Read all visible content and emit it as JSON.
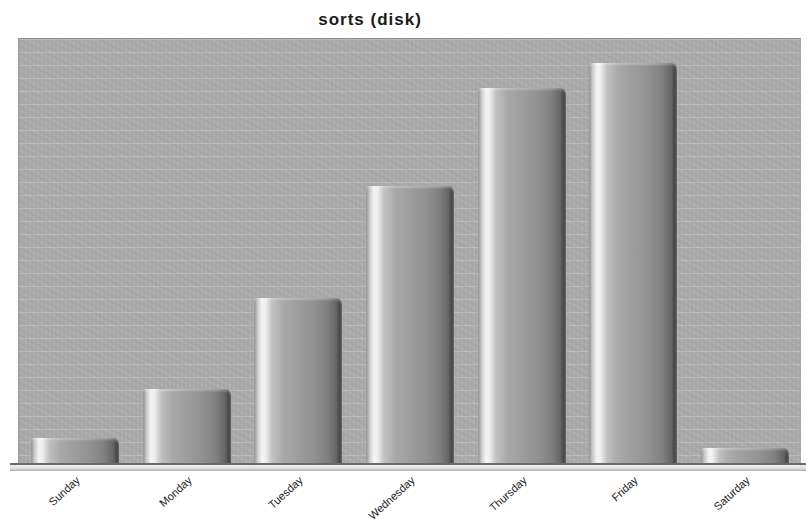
{
  "chart_data": {
    "type": "bar",
    "title": "sorts (disk)",
    "categories": [
      "Sunday",
      "Monday",
      "Tuesday",
      "Wednesday",
      "Thursday",
      "Friday",
      "Saturday"
    ],
    "values_relative_pct": [
      6.3,
      17.8,
      39.2,
      65.5,
      88.5,
      94.4,
      4.0
    ],
    "xlabel": "",
    "ylabel": "",
    "y_axis_tick_labels": [],
    "axis_ranges": {
      "y_pct": [
        0,
        100
      ]
    },
    "legend": "none",
    "grid": "faint horizontal light stripes on gray background",
    "bar_style": "3d-cylinder with left white highlight and dark right edge",
    "colors": {
      "page_background": "#ffffff",
      "plot_background": "#acacac",
      "grid_stripe": "#c8c8c8",
      "bar_highlight": "#f4f4f4",
      "bar_body": "#9d9d9d",
      "bar_dark_edge": "#484848",
      "axis_line": "#6a6a6a",
      "axis_base_strip": "#e8e8e8",
      "title_text": "#1b1b1b",
      "tick_label_text": "#1c1c1c"
    }
  }
}
